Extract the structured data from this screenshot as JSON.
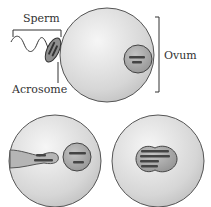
{
  "labels": {
    "sperm": "Sperm",
    "acrosome": "Acrosome",
    "ovum": "Ovum"
  },
  "stages": [
    {
      "name": "sperm-contacts-ovum"
    },
    {
      "name": "sperm-nucleus-enters-ovum"
    },
    {
      "name": "nuclei-fuse-zygote"
    }
  ],
  "colors": {
    "cell_fill": "#d9d9d9",
    "cell_highlight": "#f4f4f4",
    "nucleus_fill": "#a8a8a8",
    "chromosome": "#555555",
    "outline": "#555555"
  }
}
